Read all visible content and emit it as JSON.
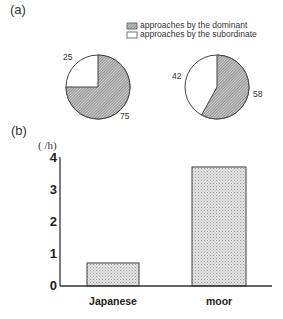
{
  "panel_a": {
    "label": "(a)",
    "legend": [
      {
        "label": "approaches by the dominant",
        "pattern": "hatched"
      },
      {
        "label": "approaches by the subordinate",
        "pattern": "white"
      }
    ],
    "pies": [
      {
        "dominant": 75,
        "subordinate": 25,
        "dominant_label": "75",
        "subordinate_label": "25"
      },
      {
        "dominant": 58,
        "subordinate": 42,
        "dominant_label": "58",
        "subordinate_label": "42"
      }
    ]
  },
  "panel_b": {
    "label": "(b)",
    "unit": "( /h)",
    "yticks": [
      "0",
      "1",
      "2",
      "3",
      "4"
    ],
    "categories": [
      "Japanese",
      "moor"
    ]
  },
  "chart_data": [
    {
      "type": "pie",
      "title": "(a) left",
      "labels": [
        "approaches by the dominant",
        "approaches by the subordinate"
      ],
      "values": [
        75,
        25
      ]
    },
    {
      "type": "pie",
      "title": "(a) right",
      "labels": [
        "approaches by the dominant",
        "approaches by the subordinate"
      ],
      "values": [
        58,
        42
      ]
    },
    {
      "type": "bar",
      "title": "(b)",
      "categories": [
        "Japanese",
        "moor"
      ],
      "values": [
        0.72,
        3.72
      ],
      "xlabel": "",
      "ylabel": "( /h)",
      "ylim": [
        0,
        4
      ],
      "yticks": [
        0,
        1,
        2,
        3,
        4
      ],
      "grid": false
    }
  ]
}
